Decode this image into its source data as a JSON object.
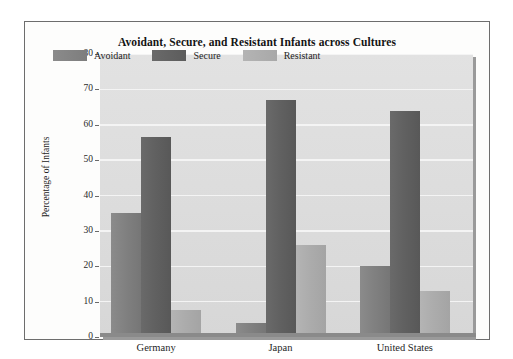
{
  "chart_data": {
    "type": "bar",
    "title": "Avoidant, Secure, and Resistant Infants across Cultures",
    "xlabel": "",
    "ylabel": "Percentage of Infants",
    "categories": [
      "Germany",
      "Japan",
      "United States"
    ],
    "series": [
      {
        "name": "Avoidant",
        "values": [
          35,
          4,
          20
        ],
        "color": "#818181"
      },
      {
        "name": "Secure",
        "values": [
          56.5,
          67,
          64
        ],
        "color": "#616161"
      },
      {
        "name": "Resistant",
        "values": [
          7.5,
          26,
          13
        ],
        "color": "#acacac"
      }
    ],
    "ylim": [
      0,
      80
    ],
    "ytick_step": 10,
    "ytick_labels": [
      "0",
      "10",
      "20",
      "30",
      "40",
      "50",
      "60",
      "70",
      "80"
    ],
    "grid": true,
    "legend_position": "top-left-inside",
    "plot_background": "#dcdcdc"
  }
}
